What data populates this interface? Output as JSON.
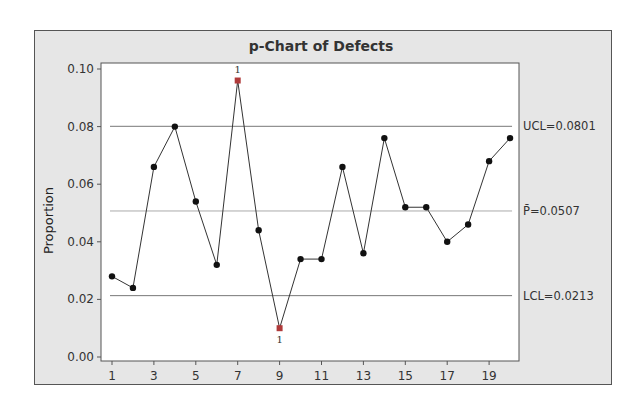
{
  "chart_data": {
    "type": "line",
    "title": "p-Chart of Defects",
    "xlabel": "",
    "ylabel": "Proportion",
    "x": [
      1,
      2,
      3,
      4,
      5,
      6,
      7,
      8,
      9,
      10,
      11,
      12,
      13,
      14,
      15,
      16,
      17,
      18,
      19,
      20
    ],
    "series": [
      {
        "name": "Proportion",
        "values": [
          0.028,
          0.024,
          0.066,
          0.08,
          0.054,
          0.032,
          0.096,
          0.044,
          0.01,
          0.034,
          0.034,
          0.066,
          0.036,
          0.076,
          0.052,
          0.052,
          0.04,
          0.046,
          0.068,
          0.076
        ]
      }
    ],
    "out_of_control_points": [
      {
        "x": 7,
        "value": 0.096,
        "label": "1"
      },
      {
        "x": 9,
        "value": 0.01,
        "label": "1"
      }
    ],
    "control_limits": {
      "UCL": {
        "value": 0.0801,
        "label": "UCL=0.0801"
      },
      "center": {
        "value": 0.0507,
        "label": "P̄=0.0507"
      },
      "LCL": {
        "value": 0.0213,
        "label": "LCL=0.0213"
      }
    },
    "yticks": [
      "0.00",
      "0.02",
      "0.04",
      "0.06",
      "0.08",
      "0.10"
    ],
    "xticks": [
      "1",
      "3",
      "5",
      "7",
      "9",
      "11",
      "13",
      "15",
      "17",
      "19"
    ],
    "ylim": [
      0,
      0.1
    ],
    "xlim": [
      1,
      20
    ],
    "grid": false,
    "legend": "none"
  },
  "labels": {
    "title": "p-Chart of Defects",
    "ylabel": "Proportion",
    "ucl": "UCL=0.0801",
    "center": "P̄=0.0507",
    "lcl": "LCL=0.0213"
  },
  "colors": {
    "frame_bg": "#e6e6e6",
    "plot_bg": "#ffffff",
    "line": "#333333",
    "point": "#111111",
    "flagged_point": "#b03a3a",
    "limit_line": "#777777",
    "center_line": "#aaaaaa"
  }
}
